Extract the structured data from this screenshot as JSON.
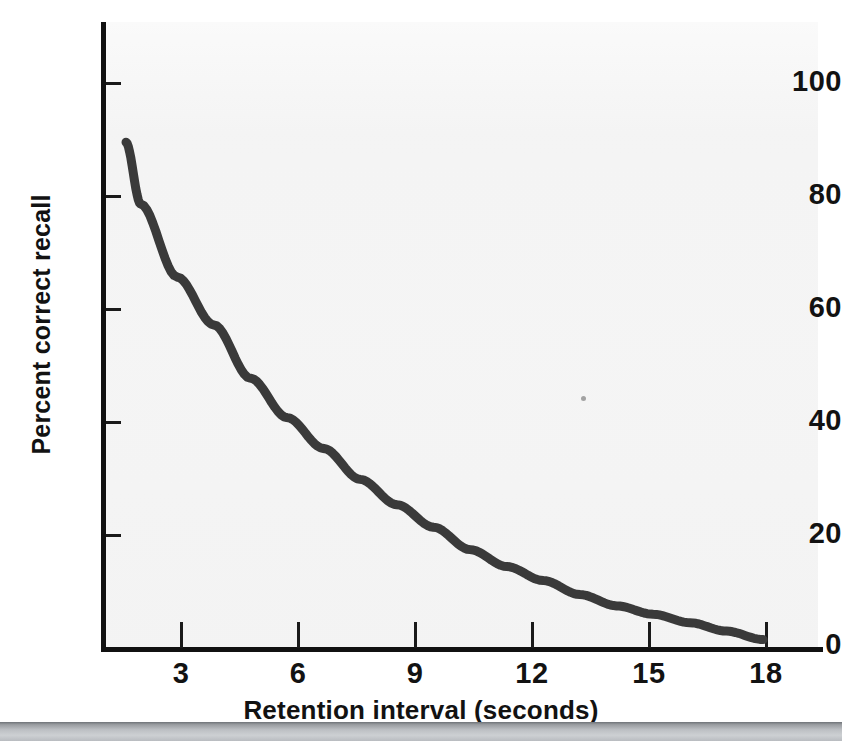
{
  "figure": {
    "background_color": "#ffffff",
    "plot_background_color": "#f4f4f4",
    "curve_color": "#3a3a3a",
    "axis_color": "#111111",
    "band_color": "#b9bcc0"
  },
  "chart_data": {
    "type": "line",
    "title": "",
    "subtitle": "",
    "xlabel": "Retention interval (seconds)",
    "ylabel": "Percent correct recall",
    "xlim": [
      0,
      19.5
    ],
    "ylim": [
      0,
      111
    ],
    "xticks": [
      3,
      6,
      9,
      12,
      15,
      18
    ],
    "xticklabels": [
      "3",
      "6",
      "9",
      "12",
      "15",
      "18"
    ],
    "yticks": [
      0,
      20,
      40,
      60,
      80,
      100
    ],
    "yticklabels": [
      "0",
      "20",
      "40",
      "60",
      "80",
      "100"
    ],
    "grid": false,
    "legend": null,
    "annotations": [],
    "series": [
      {
        "name": "Percent correct recall",
        "x": [
          0.6,
          1,
          2,
          3,
          4,
          5,
          6,
          7,
          8,
          9,
          10,
          11,
          12,
          13,
          14,
          15,
          16,
          17,
          18
        ],
        "y": [
          90,
          79,
          66,
          57.5,
          48,
          41,
          35.5,
          30,
          25.5,
          21.5,
          17.5,
          14.5,
          12,
          9.5,
          7.5,
          6,
          4.5,
          3,
          1.5
        ]
      }
    ]
  }
}
